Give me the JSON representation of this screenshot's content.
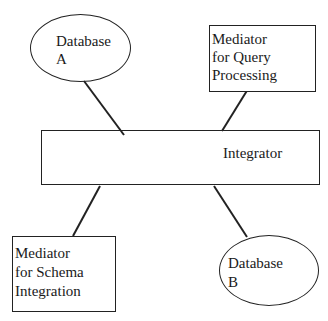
{
  "diagram": {
    "type": "architecture",
    "nodes": [
      {
        "id": "db_a",
        "shape": "ellipse",
        "lines": [
          "Database",
          "A"
        ]
      },
      {
        "id": "mqp",
        "shape": "rectangle",
        "lines": [
          "Mediator",
          "for Query",
          "Processing"
        ]
      },
      {
        "id": "integrator",
        "shape": "rectangle",
        "lines": [
          "Integrator"
        ]
      },
      {
        "id": "msi",
        "shape": "rectangle",
        "lines": [
          "Mediator",
          "for Schema",
          "Integration"
        ]
      },
      {
        "id": "db_b",
        "shape": "ellipse",
        "lines": [
          "Database",
          "B"
        ]
      }
    ],
    "edges": [
      {
        "from": "db_a",
        "to": "integrator"
      },
      {
        "from": "mqp",
        "to": "integrator"
      },
      {
        "from": "integrator",
        "to": "msi"
      },
      {
        "from": "integrator",
        "to": "db_b"
      }
    ]
  },
  "colors": {
    "stroke": "#222222",
    "background": "#ffffff",
    "text": "#1a1a1a"
  }
}
